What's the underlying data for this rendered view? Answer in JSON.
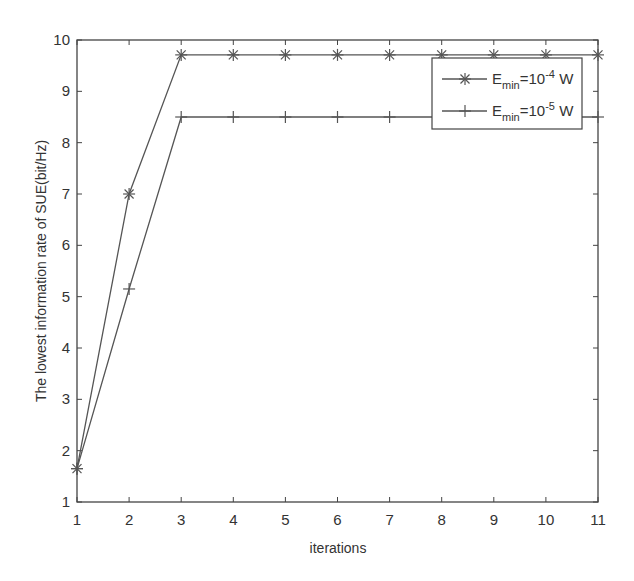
{
  "chart_data": {
    "type": "line",
    "title": "",
    "xlabel": "iterations",
    "ylabel": "The lowest information rate of SUE(bit/Hz)",
    "x": [
      1,
      2,
      3,
      4,
      5,
      6,
      7,
      8,
      9,
      10,
      11
    ],
    "xlim": [
      1,
      11
    ],
    "ylim": [
      1,
      10
    ],
    "xticks": [
      "1",
      "2",
      "3",
      "4",
      "5",
      "6",
      "7",
      "8",
      "9",
      "10",
      "11"
    ],
    "yticks": [
      "1",
      "2",
      "3",
      "4",
      "5",
      "6",
      "7",
      "8",
      "9",
      "10"
    ],
    "grid": false,
    "legend_position": "upper right",
    "series": [
      {
        "name": "E_min=10^-4 W",
        "label_base": "E",
        "label_sub": "min",
        "label_mid": "=10",
        "label_sup": "-4",
        "label_tail": " W",
        "marker": "asterisk",
        "values": [
          1.65,
          7.0,
          9.71,
          9.71,
          9.71,
          9.71,
          9.71,
          9.71,
          9.71,
          9.71,
          9.71
        ]
      },
      {
        "name": "E_min=10^-5 W",
        "label_base": "E",
        "label_sub": "min",
        "label_mid": "=10",
        "label_sup": "-5",
        "label_tail": " W",
        "marker": "plus",
        "values": [
          1.65,
          5.15,
          8.5,
          8.5,
          8.5,
          8.5,
          8.5,
          8.5,
          8.5,
          8.5,
          8.5
        ]
      }
    ],
    "colors": {
      "line": "#555555",
      "axis": "#444444",
      "text": "#333333"
    }
  }
}
